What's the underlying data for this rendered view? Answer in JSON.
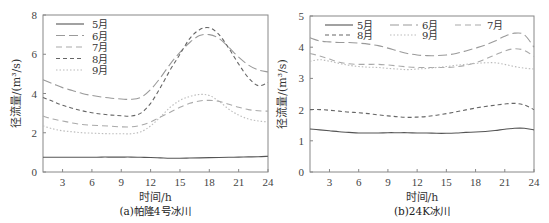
{
  "chart_data": [
    {
      "type": "line",
      "caption": "(a)帕隆4号冰川",
      "xlabel": "时间/h",
      "ylabel": "径流量/(m³/s)",
      "xlim": [
        1,
        24
      ],
      "ylim": [
        0,
        8
      ],
      "xticks": [
        3,
        6,
        9,
        12,
        15,
        18,
        21,
        24
      ],
      "yticks": [
        0,
        2,
        4,
        6,
        8
      ],
      "grid": false,
      "legend_position": "upper-left",
      "x": [
        1,
        2,
        3,
        4,
        5,
        6,
        7,
        8,
        9,
        10,
        11,
        12,
        13,
        14,
        15,
        16,
        17,
        18,
        19,
        20,
        21,
        22,
        23,
        24
      ],
      "series": [
        {
          "name": "5月",
          "style": "solid",
          "values": [
            0.75,
            0.75,
            0.75,
            0.75,
            0.75,
            0.75,
            0.76,
            0.76,
            0.76,
            0.76,
            0.75,
            0.74,
            0.72,
            0.7,
            0.7,
            0.71,
            0.72,
            0.73,
            0.74,
            0.75,
            0.76,
            0.77,
            0.78,
            0.8
          ]
        },
        {
          "name": "6月",
          "style": "long-dash",
          "values": [
            4.7,
            4.5,
            4.3,
            4.15,
            4.0,
            3.9,
            3.82,
            3.76,
            3.72,
            3.7,
            3.8,
            4.2,
            4.8,
            5.5,
            6.1,
            6.6,
            6.95,
            7.0,
            6.8,
            6.35,
            5.85,
            5.45,
            5.2,
            5.1
          ]
        },
        {
          "name": "7月",
          "style": "dash",
          "values": [
            2.85,
            2.7,
            2.6,
            2.5,
            2.42,
            2.38,
            2.36,
            2.33,
            2.3,
            2.3,
            2.38,
            2.55,
            2.8,
            3.05,
            3.3,
            3.5,
            3.62,
            3.65,
            3.6,
            3.45,
            3.3,
            3.18,
            3.12,
            3.1
          ]
        },
        {
          "name": "8月",
          "style": "short-dash",
          "values": [
            3.8,
            3.6,
            3.4,
            3.25,
            3.12,
            3.02,
            2.95,
            2.9,
            2.87,
            2.85,
            3.0,
            3.5,
            4.3,
            5.2,
            6.0,
            6.8,
            7.25,
            7.35,
            7.0,
            6.3,
            5.5,
            4.8,
            4.4,
            4.55
          ]
        },
        {
          "name": "9月",
          "style": "dotted",
          "values": [
            2.35,
            2.2,
            2.1,
            2.05,
            2.0,
            1.98,
            1.96,
            1.95,
            1.95,
            1.95,
            2.05,
            2.35,
            2.8,
            3.3,
            3.65,
            3.85,
            3.95,
            3.9,
            3.6,
            3.2,
            2.9,
            2.7,
            2.6,
            2.55
          ]
        }
      ]
    },
    {
      "type": "line",
      "caption": "(b)24K冰川",
      "xlabel": "时间/h",
      "ylabel": "径流量/(m³/s)",
      "xlim": [
        1,
        24
      ],
      "ylim": [
        0,
        5
      ],
      "xticks": [
        3,
        6,
        9,
        12,
        15,
        18,
        21,
        24
      ],
      "yticks": [
        0,
        1,
        2,
        3,
        4,
        5
      ],
      "grid": false,
      "legend_position": "top",
      "x": [
        1,
        2,
        3,
        4,
        5,
        6,
        7,
        8,
        9,
        10,
        11,
        12,
        13,
        14,
        15,
        16,
        17,
        18,
        19,
        20,
        21,
        22,
        23,
        24
      ],
      "series": [
        {
          "name": "5月",
          "style": "solid",
          "values": [
            1.38,
            1.35,
            1.32,
            1.29,
            1.27,
            1.25,
            1.25,
            1.25,
            1.26,
            1.26,
            1.26,
            1.25,
            1.25,
            1.24,
            1.24,
            1.25,
            1.27,
            1.28,
            1.3,
            1.33,
            1.37,
            1.4,
            1.4,
            1.35
          ]
        },
        {
          "name": "6月",
          "style": "long-dash",
          "values": [
            4.3,
            4.2,
            4.17,
            4.15,
            4.15,
            4.13,
            4.1,
            4.05,
            3.97,
            3.88,
            3.8,
            3.75,
            3.73,
            3.73,
            3.75,
            3.8,
            3.88,
            3.97,
            4.07,
            4.2,
            4.35,
            4.45,
            4.4,
            4.0
          ]
        },
        {
          "name": "7月",
          "style": "dash",
          "values": [
            3.8,
            3.72,
            3.62,
            3.52,
            3.47,
            3.45,
            3.45,
            3.45,
            3.43,
            3.4,
            3.37,
            3.35,
            3.35,
            3.35,
            3.35,
            3.37,
            3.42,
            3.5,
            3.62,
            3.75,
            3.88,
            3.95,
            3.9,
            3.7
          ]
        },
        {
          "name": "8月",
          "style": "short-dash",
          "values": [
            2.0,
            2.0,
            1.98,
            1.95,
            1.92,
            1.9,
            1.87,
            1.83,
            1.8,
            1.77,
            1.75,
            1.76,
            1.78,
            1.82,
            1.87,
            1.93,
            1.99,
            2.05,
            2.1,
            2.14,
            2.18,
            2.2,
            2.15,
            2.0
          ]
        },
        {
          "name": "9月",
          "style": "dotted",
          "values": [
            3.55,
            3.6,
            3.55,
            3.48,
            3.42,
            3.38,
            3.36,
            3.35,
            3.32,
            3.3,
            3.28,
            3.3,
            3.32,
            3.35,
            3.38,
            3.42,
            3.45,
            3.48,
            3.5,
            3.5,
            3.45,
            3.38,
            3.33,
            3.3
          ]
        }
      ]
    }
  ],
  "styles": {
    "solid": {
      "color": "#555555",
      "dash": ""
    },
    "long-dash": {
      "color": "#9a9a9a",
      "dash": "9,4"
    },
    "dash": {
      "color": "#aaaaaa",
      "dash": "6,4"
    },
    "short-dash": {
      "color": "#666666",
      "dash": "4,3"
    },
    "dotted": {
      "color": "#bbbbbb",
      "dash": "1.5,2"
    }
  }
}
